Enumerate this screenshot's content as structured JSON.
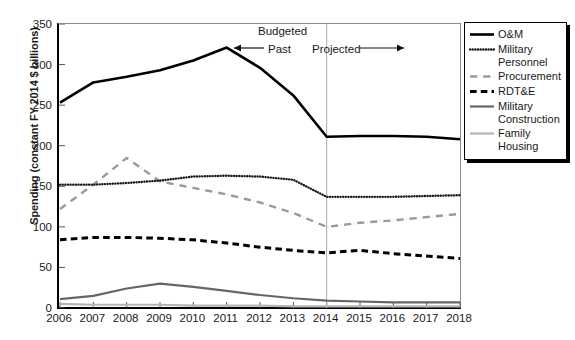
{
  "chart_data": {
    "type": "line",
    "title": "",
    "xlabel": "",
    "ylabel": "Spending (constant FY 2014 $ billions)",
    "x": [
      2006,
      2007,
      2008,
      2009,
      2010,
      2011,
      2012,
      2013,
      2014,
      2015,
      2016,
      2017,
      2018
    ],
    "xticklabels": [
      "2006",
      "2007",
      "2008",
      "2009",
      "2010",
      "2011",
      "2012",
      "2013",
      "2014",
      "2015",
      "2016",
      "2017",
      "2018"
    ],
    "yticklabels": [
      "0",
      "50",
      "100",
      "150",
      "200",
      "250",
      "300",
      "350"
    ],
    "yticks": [
      0,
      50,
      100,
      150,
      200,
      250,
      300,
      350
    ],
    "ylim": [
      0,
      350
    ],
    "xlim": [
      2006,
      2018
    ],
    "grid": false,
    "legend_position": "right-outside",
    "series": [
      {
        "name": "O&M",
        "style": "solid",
        "color": "#000000",
        "width": 2.6,
        "values": [
          253,
          278,
          285,
          293,
          305,
          321,
          296,
          262,
          211,
          212,
          212,
          211,
          208
        ]
      },
      {
        "name": "Military\nPersonnel",
        "style": "dotted",
        "color": "#1a1a1a",
        "width": 2.4,
        "values": [
          152,
          152,
          154,
          157,
          162,
          163,
          162,
          158,
          137,
          137,
          137,
          138,
          139
        ]
      },
      {
        "name": "Procurement",
        "style": "dashdot",
        "color": "#9a9a9a",
        "width": 2.4,
        "values": [
          122,
          152,
          185,
          156,
          148,
          140,
          130,
          117,
          100,
          105,
          108,
          112,
          116
        ]
      },
      {
        "name": "RDT&E",
        "style": "dashed",
        "color": "#000000",
        "width": 3.0,
        "values": [
          84,
          87,
          87,
          86,
          84,
          80,
          75,
          71,
          68,
          71,
          67,
          64,
          61
        ]
      },
      {
        "name": "Military\nConstruction",
        "style": "solid",
        "color": "#666666",
        "width": 2.2,
        "values": [
          11,
          15,
          24,
          30,
          26,
          21,
          16,
          12,
          9,
          8,
          7,
          7,
          7
        ]
      },
      {
        "name": "Family\nHousing",
        "style": "solid",
        "color": "#b5b5b5",
        "width": 2.2,
        "values": [
          5,
          4,
          4,
          4,
          3,
          3,
          3,
          2,
          2,
          2,
          2,
          2,
          2
        ]
      }
    ],
    "annotations": {
      "budgeted": "Budgeted",
      "past": "Past",
      "projected": "Projected",
      "divider_year": 2014
    }
  }
}
